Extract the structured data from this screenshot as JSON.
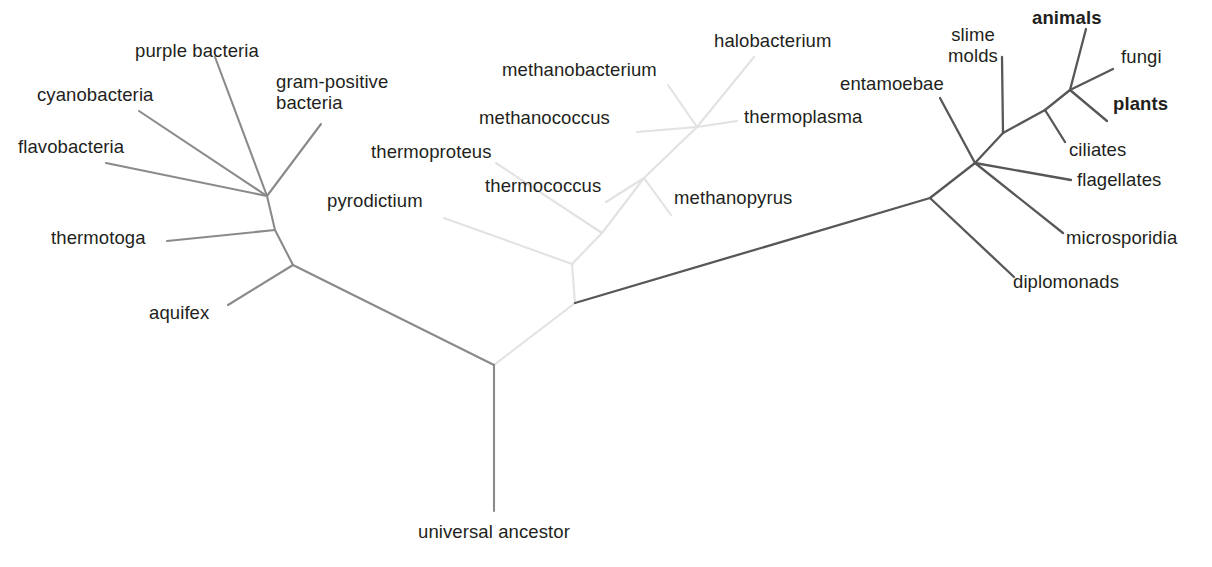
{
  "figure": {
    "type": "unrooted-phylogenetic-tree",
    "title": "",
    "background_color": "#ffffff",
    "domains": [
      {
        "key": "bacteria",
        "name": "Bacteria",
        "line_color": "#8a8a8a",
        "line_width": 2.1
      },
      {
        "key": "archaea",
        "name": "Archaea",
        "line_color": "#e2e2e2",
        "line_width": 2.1
      },
      {
        "key": "eukaryota",
        "name": "Eukaryota",
        "line_width": 2.3,
        "line_color": "#575757"
      }
    ],
    "text_color": "#231f20",
    "root_label": "universal ancestor"
  },
  "chart_data": {
    "type": "diagram",
    "subtype": "unrooted phylogenetic tree of life (three domains)",
    "title": "",
    "nodes": {
      "root": {
        "x": 494,
        "y": 365
      },
      "bacteria_base": {
        "x": 293,
        "y": 265
      },
      "bacteria_mid": {
        "x": 275,
        "y": 230
      },
      "bacteria_crown": {
        "x": 267,
        "y": 196
      },
      "archaea_base": {
        "x": 575,
        "y": 303
      },
      "archaea_split": {
        "x": 572,
        "y": 264
      },
      "crenarchaeota": {
        "x": 602,
        "y": 233
      },
      "euryarchaeota": {
        "x": 644,
        "y": 178
      },
      "halo_thermo": {
        "x": 697,
        "y": 127
      },
      "eukaryota_base": {
        "x": 930,
        "y": 198
      },
      "euk_node2": {
        "x": 975,
        "y": 163
      },
      "euk_node3": {
        "x": 1003,
        "y": 133
      },
      "euk_node4": {
        "x": 1045,
        "y": 110
      },
      "crown_node": {
        "x": 1070,
        "y": 90
      }
    },
    "branches": [
      {
        "domain": "bacteria",
        "from": "root",
        "to": "bacteria_base"
      },
      {
        "domain": "bacteria",
        "from": "bacteria_base",
        "to": "bacteria_mid"
      },
      {
        "domain": "bacteria",
        "from": "bacteria_mid",
        "to": "bacteria_crown"
      },
      {
        "domain": "bacteria",
        "from": "bacteria_base",
        "to": "aquifex_tip"
      },
      {
        "domain": "bacteria",
        "from": "bacteria_mid",
        "to": "thermotoga_tip"
      },
      {
        "domain": "bacteria",
        "from": "bacteria_crown",
        "to": "flavobacteria_tip"
      },
      {
        "domain": "bacteria",
        "from": "bacteria_crown",
        "to": "cyanobacteria_tip"
      },
      {
        "domain": "bacteria",
        "from": "bacteria_crown",
        "to": "purple_bacteria_tip"
      },
      {
        "domain": "bacteria",
        "from": "bacteria_crown",
        "to": "gram_positive_tip"
      },
      {
        "domain": "archaea",
        "from": "root",
        "to": "archaea_base"
      },
      {
        "domain": "archaea",
        "from": "archaea_base",
        "to": "archaea_split"
      },
      {
        "domain": "archaea",
        "from": "archaea_split",
        "to": "pyrodictium_tip"
      },
      {
        "domain": "archaea",
        "from": "archaea_split",
        "to": "crenarchaeota"
      },
      {
        "domain": "archaea",
        "from": "crenarchaeota",
        "to": "thermoproteus_tip"
      },
      {
        "domain": "archaea",
        "from": "crenarchaeota",
        "to": "euryarchaeota"
      },
      {
        "domain": "archaea",
        "from": "euryarchaeota",
        "to": "thermococcus_tip"
      },
      {
        "domain": "archaea",
        "from": "euryarchaeota",
        "to": "methanopyrus_tip"
      },
      {
        "domain": "archaea",
        "from": "euryarchaeota",
        "to": "halo_thermo"
      },
      {
        "domain": "archaea",
        "from": "halo_thermo",
        "to": "methanobacterium_tip"
      },
      {
        "domain": "archaea",
        "from": "halo_thermo",
        "to": "methanococcus_tip"
      },
      {
        "domain": "archaea",
        "from": "halo_thermo",
        "to": "halobacterium_tip"
      },
      {
        "domain": "archaea",
        "from": "halo_thermo",
        "to": "thermoplasma_tip"
      },
      {
        "domain": "eukaryota",
        "from": "archaea_base",
        "to": "eukaryota_base"
      },
      {
        "domain": "eukaryota",
        "from": "eukaryota_base",
        "to": "diplomonads_tip"
      },
      {
        "domain": "eukaryota",
        "from": "eukaryota_base",
        "to": "euk_node2"
      },
      {
        "domain": "eukaryota",
        "from": "euk_node2",
        "to": "microsporidia_tip"
      },
      {
        "domain": "eukaryota",
        "from": "euk_node2",
        "to": "entamoebae_tip"
      },
      {
        "domain": "eukaryota",
        "from": "euk_node2",
        "to": "flagellates_tip"
      },
      {
        "domain": "eukaryota",
        "from": "euk_node2",
        "to": "euk_node3"
      },
      {
        "domain": "eukaryota",
        "from": "euk_node3",
        "to": "slime_molds_tip"
      },
      {
        "domain": "eukaryota",
        "from": "euk_node3",
        "to": "euk_node4"
      },
      {
        "domain": "eukaryota",
        "from": "euk_node4",
        "to": "ciliates_tip"
      },
      {
        "domain": "eukaryota",
        "from": "euk_node4",
        "to": "crown_node"
      },
      {
        "domain": "eukaryota",
        "from": "crown_node",
        "to": "animals_tip"
      },
      {
        "domain": "eukaryota",
        "from": "crown_node",
        "to": "fungi_tip"
      },
      {
        "domain": "eukaryota",
        "from": "crown_node",
        "to": "plants_tip"
      }
    ],
    "taxa": [
      {
        "id": "flavobacteria_tip",
        "label": "flavobacteria",
        "domain": "bacteria",
        "bold": false,
        "tip": {
          "x": 106,
          "y": 163
        },
        "label_pos": {
          "x": 18,
          "y": 137
        },
        "align": "left"
      },
      {
        "id": "cyanobacteria_tip",
        "label": "cyanobacteria",
        "domain": "bacteria",
        "bold": false,
        "tip": {
          "x": 139,
          "y": 111
        },
        "label_pos": {
          "x": 37,
          "y": 85
        },
        "align": "left"
      },
      {
        "id": "purple_bacteria_tip",
        "label": "purple bacteria",
        "domain": "bacteria",
        "bold": false,
        "tip": {
          "x": 215,
          "y": 57
        },
        "label_pos": {
          "x": 135,
          "y": 41
        },
        "align": "left"
      },
      {
        "id": "gram_positive_tip",
        "label": "gram-positive\nbacteria",
        "domain": "bacteria",
        "bold": false,
        "tip": {
          "x": 321,
          "y": 124
        },
        "label_pos": {
          "x": 276,
          "y": 72
        },
        "align": "left"
      },
      {
        "id": "thermotoga_tip",
        "label": "thermotoga",
        "domain": "bacteria",
        "bold": false,
        "tip": {
          "x": 167,
          "y": 241
        },
        "label_pos": {
          "x": 51,
          "y": 228
        },
        "align": "left"
      },
      {
        "id": "aquifex_tip",
        "label": "aquifex",
        "domain": "bacteria",
        "bold": false,
        "tip": {
          "x": 228,
          "y": 305
        },
        "label_pos": {
          "x": 149,
          "y": 303
        },
        "align": "left"
      },
      {
        "id": "pyrodictium_tip",
        "label": "pyrodictium",
        "domain": "archaea",
        "bold": false,
        "tip": {
          "x": 444,
          "y": 218
        },
        "label_pos": {
          "x": 327,
          "y": 191
        },
        "align": "left"
      },
      {
        "id": "thermoproteus_tip",
        "label": "thermoproteus",
        "domain": "archaea",
        "bold": false,
        "tip": {
          "x": 496,
          "y": 163
        },
        "label_pos": {
          "x": 371,
          "y": 142
        },
        "align": "left"
      },
      {
        "id": "thermococcus_tip",
        "label": "thermococcus",
        "domain": "archaea",
        "bold": false,
        "tip": {
          "x": 606,
          "y": 202
        },
        "label_pos": {
          "x": 485,
          "y": 176
        },
        "align": "left"
      },
      {
        "id": "methanococcus_tip",
        "label": "methanococcus",
        "domain": "archaea",
        "bold": false,
        "tip": {
          "x": 637,
          "y": 132
        },
        "label_pos": {
          "x": 479,
          "y": 108
        },
        "align": "left"
      },
      {
        "id": "methanobacterium_tip",
        "label": "methanobacterium",
        "domain": "archaea",
        "bold": false,
        "tip": {
          "x": 668,
          "y": 85
        },
        "label_pos": {
          "x": 502,
          "y": 60
        },
        "align": "left"
      },
      {
        "id": "halobacterium_tip",
        "label": "halobacterium",
        "domain": "archaea",
        "bold": false,
        "tip": {
          "x": 754,
          "y": 57
        },
        "label_pos": {
          "x": 714,
          "y": 31
        },
        "align": "left"
      },
      {
        "id": "thermoplasma_tip",
        "label": "thermoplasma",
        "domain": "archaea",
        "bold": false,
        "tip": {
          "x": 737,
          "y": 121
        },
        "label_pos": {
          "x": 744,
          "y": 107
        },
        "align": "left"
      },
      {
        "id": "methanopyrus_tip",
        "label": "methanopyrus",
        "domain": "archaea",
        "bold": false,
        "tip": {
          "x": 671,
          "y": 215
        },
        "label_pos": {
          "x": 674,
          "y": 188
        },
        "align": "left"
      },
      {
        "id": "diplomonads_tip",
        "label": "diplomonads",
        "domain": "eukaryota",
        "bold": false,
        "tip": {
          "x": 1014,
          "y": 277
        },
        "label_pos": {
          "x": 1013,
          "y": 272
        },
        "align": "left"
      },
      {
        "id": "microsporidia_tip",
        "label": "microsporidia",
        "domain": "eukaryota",
        "bold": false,
        "tip": {
          "x": 1063,
          "y": 233
        },
        "label_pos": {
          "x": 1066,
          "y": 228
        },
        "align": "left"
      },
      {
        "id": "flagellates_tip",
        "label": "flagellates",
        "domain": "eukaryota",
        "bold": false,
        "tip": {
          "x": 1071,
          "y": 180
        },
        "label_pos": {
          "x": 1077,
          "y": 170
        },
        "align": "left"
      },
      {
        "id": "entamoebae_tip",
        "label": "entamoebae",
        "domain": "eukaryota",
        "bold": false,
        "tip": {
          "x": 940,
          "y": 98
        },
        "label_pos": {
          "x": 840,
          "y": 74
        },
        "align": "left"
      },
      {
        "id": "slime_molds_tip",
        "label": "slime\nmolds",
        "domain": "eukaryota",
        "bold": false,
        "tip": {
          "x": 1002,
          "y": 57
        },
        "label_pos": {
          "x": 973,
          "y": 25
        },
        "align": "center"
      },
      {
        "id": "ciliates_tip",
        "label": "ciliates",
        "domain": "eukaryota",
        "bold": false,
        "tip": {
          "x": 1065,
          "y": 142
        },
        "label_pos": {
          "x": 1069,
          "y": 140
        },
        "align": "left"
      },
      {
        "id": "animals_tip",
        "label": "animals",
        "domain": "eukaryota",
        "bold": true,
        "tip": {
          "x": 1086,
          "y": 29
        },
        "label_pos": {
          "x": 1032,
          "y": 8
        },
        "align": "left"
      },
      {
        "id": "fungi_tip",
        "label": "fungi",
        "domain": "eukaryota",
        "bold": false,
        "tip": {
          "x": 1113,
          "y": 69
        },
        "label_pos": {
          "x": 1121,
          "y": 47
        },
        "align": "left"
      },
      {
        "id": "plants_tip",
        "label": "plants",
        "domain": "eukaryota",
        "bold": true,
        "tip": {
          "x": 1107,
          "y": 121
        },
        "label_pos": {
          "x": 1113,
          "y": 94
        },
        "align": "left"
      }
    ],
    "root_branch": {
      "from": {
        "x": 494,
        "y": 365
      },
      "to": {
        "x": 494,
        "y": 511
      },
      "domain": "bacteria"
    },
    "root_label": {
      "text": "universal ancestor",
      "x": 494,
      "y": 522
    }
  }
}
